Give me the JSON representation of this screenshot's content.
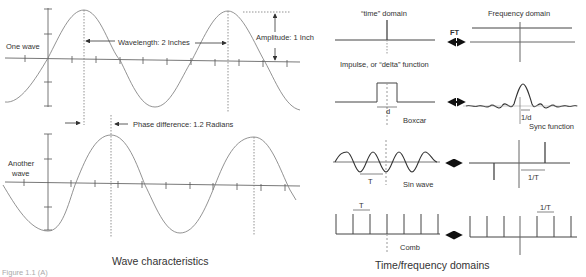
{
  "left_panel": {
    "title": "Wave characteristics",
    "wave1": {
      "label": "One wave",
      "wavelength_label": "Wavelength: 2 Inches",
      "amplitude_label": "Amplitude: 1 Inch"
    },
    "phase_label": "Phase difference: 1.2 Radians",
    "wave2": {
      "label_line1": "Another",
      "label_line2": "wave"
    },
    "figure_caption": "Figure 1.1 (A)"
  },
  "right_panel": {
    "title": "Time/frequency domains",
    "time_header": "“time” domain",
    "freq_header": "Frequency domain",
    "ft_label": "FT",
    "rows": [
      {
        "name": "impulse",
        "time_label": "Impulse, or “delta” function",
        "freq_label": ""
      },
      {
        "name": "boxcar",
        "time_label": "Boxcar",
        "time_dim": "d",
        "freq_label": "Sync function",
        "freq_dim": "1/d"
      },
      {
        "name": "sin",
        "time_label": "Sin wave",
        "time_dim": "T",
        "freq_label": "",
        "freq_dim": "1/T"
      },
      {
        "name": "comb",
        "time_label": "Comb",
        "time_dim": "T",
        "freq_label": "",
        "freq_dim": "1/T"
      }
    ]
  },
  "colors": {
    "line": "#555555",
    "text": "#333333",
    "background": "#ffffff"
  }
}
